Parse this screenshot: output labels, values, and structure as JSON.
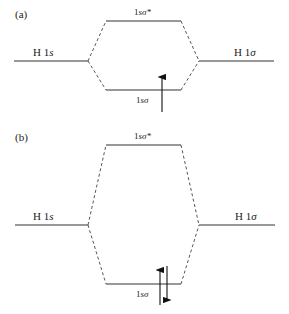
{
  "panels": [
    {
      "id": "a",
      "label": "(a)",
      "left_orbital": {
        "label_main": "H 1",
        "label_sub": "s"
      },
      "right_orbital": {
        "label_main": "H 1",
        "label_sub": "σ"
      },
      "antibonding": {
        "label_main": "1",
        "label_sub": "sσ*"
      },
      "bonding": {
        "label_main": "1",
        "label_sub": "sσ"
      },
      "electrons": {
        "bonding": "↑",
        "count": 1
      }
    },
    {
      "id": "b",
      "label": "(b)",
      "left_orbital": {
        "label_main": "H 1",
        "label_sub": "s"
      },
      "right_orbital": {
        "label_main": "H 1",
        "label_sub": "σ"
      },
      "antibonding": {
        "label_main": "1",
        "label_sub": "sσ*"
      },
      "bonding": {
        "label_main": "1",
        "label_sub": "sσ"
      },
      "electrons": {
        "bonding": "↑↓",
        "count": 2
      }
    }
  ]
}
